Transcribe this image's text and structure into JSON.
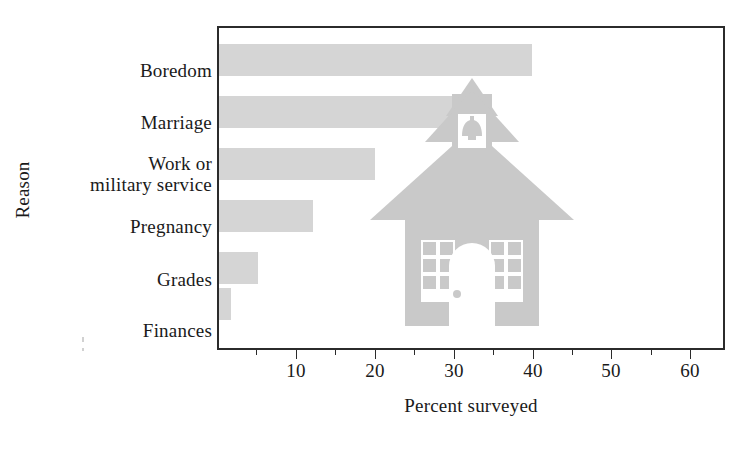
{
  "chart_data": {
    "type": "bar",
    "orientation": "horizontal",
    "title": "",
    "xlabel": "Percent surveyed",
    "ylabel": "Reason",
    "categories": [
      "Boredom",
      "Marriage",
      "Work or\nmilitary service",
      "Pregnancy",
      "Grades",
      "Finances"
    ],
    "values": [
      40,
      31,
      20,
      12,
      5,
      1.5
    ],
    "xlim": [
      0,
      64.5
    ],
    "ylim": [
      0,
      6
    ],
    "xticks": [
      10,
      20,
      30,
      40,
      50,
      60
    ],
    "xtick_labels": [
      "10",
      "20",
      "30",
      "40",
      "50",
      "60"
    ],
    "xminor_ticks": [
      5,
      15,
      25,
      35,
      45,
      55
    ],
    "grid": false,
    "legend": null,
    "bar_color": "#d5d5d5",
    "frame_color": "#2b2b2b",
    "annotations": [
      "schoolhouse illustration overlaid on plot area"
    ]
  },
  "axes": {
    "y_title": "Reason",
    "x_title": "Percent surveyed"
  },
  "decoration": {
    "schoolhouse_label": "schoolhouse-illustration",
    "schoolhouse_color": "#c9c9c9"
  },
  "colors": {
    "bar": "#d5d5d5",
    "frame": "#2b2b2b",
    "text": "#1a1a1a",
    "schoolhouse": "#c9c9c9"
  }
}
